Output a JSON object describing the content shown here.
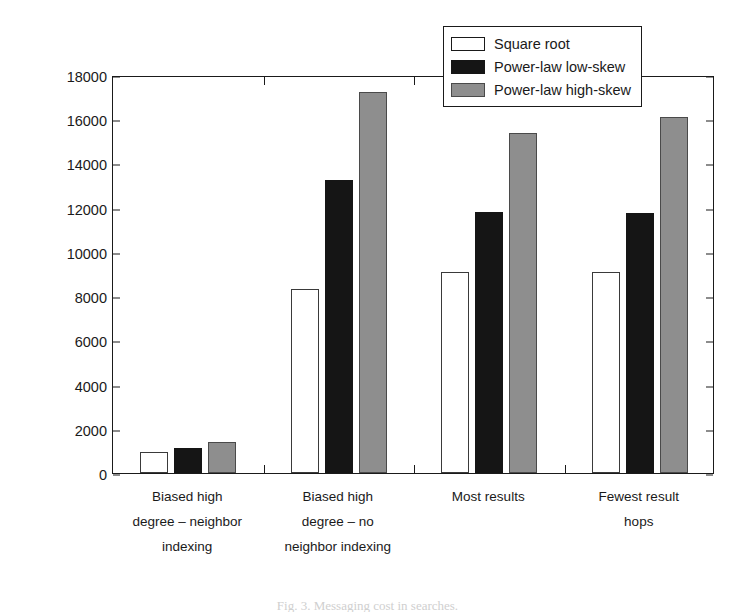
{
  "chart_data": {
    "type": "bar",
    "title": "",
    "xlabel": "",
    "ylabel": "Average number messages sent per search",
    "ylim": [
      0,
      18000
    ],
    "yticks": [
      0,
      2000,
      4000,
      6000,
      8000,
      10000,
      12000,
      14000,
      16000,
      18000
    ],
    "ytick_labels": [
      "0",
      "2000",
      "4000",
      "6000",
      "8000",
      "10000",
      "12000",
      "14000",
      "16000",
      "18000"
    ],
    "grid": false,
    "legend_position": "top-right",
    "categories": [
      "Biased high\ndegree – neighbor\nindexing",
      "Biased high\ndegree – no\nneighbor indexing",
      "Most results",
      "Fewest result\nhops"
    ],
    "series": [
      {
        "name": "Square root",
        "color": "#ffffff",
        "values": [
          950,
          8300,
          9100,
          9100
        ]
      },
      {
        "name": "Power-law low-skew",
        "color": "#151515",
        "values": [
          1150,
          13250,
          11800,
          11750
        ]
      },
      {
        "name": "Power-law high-skew",
        "color": "#8e8e8e",
        "values": [
          1400,
          17250,
          15400,
          16100
        ]
      }
    ]
  },
  "legend": {
    "items": [
      {
        "label": "Square root"
      },
      {
        "label": "Power-law low-skew"
      },
      {
        "label": "Power-law high-skew"
      }
    ]
  },
  "caption": {
    "text": "Fig. 3. Messaging cost in searches."
  }
}
